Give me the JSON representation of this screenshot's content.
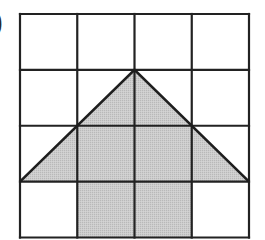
{
  "figure": {
    "label_fragment": ")",
    "grid": {
      "rows": 4,
      "cols": 4,
      "origin_x": 20,
      "origin_y": 14,
      "cell_w": 57.25,
      "cell_h": 55.875,
      "line_color": "#222222",
      "line_width": 2.2
    },
    "shaded_shape": {
      "fill_color": "#c6c6c6",
      "outline_color": "#1e1e1e",
      "outline_width": 2.6,
      "vertices_grid_units": [
        [
          2,
          1
        ],
        [
          4,
          3
        ],
        [
          3,
          3
        ],
        [
          3,
          4
        ],
        [
          1,
          4
        ],
        [
          1,
          3
        ],
        [
          0,
          3
        ]
      ]
    }
  }
}
